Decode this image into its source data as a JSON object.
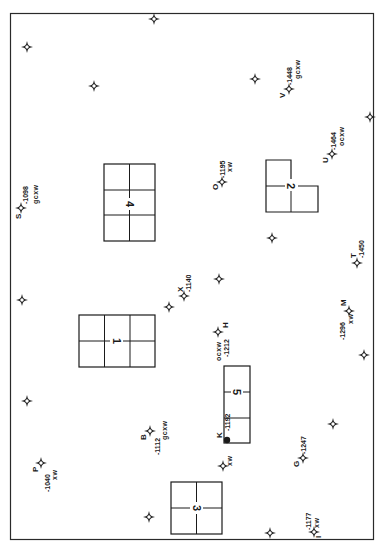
{
  "border_color": "#2a2a2a",
  "ink_color": "#1a1a1a",
  "units": [
    {
      "label": "1",
      "type": "grid-3x2"
    },
    {
      "label": "2",
      "type": "l-shape"
    },
    {
      "label": "3",
      "type": "grid-2x2"
    },
    {
      "label": "4",
      "type": "grid-3x2"
    },
    {
      "label": "5",
      "type": "strip-3"
    }
  ],
  "points": [
    {
      "id": "V",
      "letter": "V",
      "value": "-1448",
      "code": "gcxw",
      "symbol": "star"
    },
    {
      "id": "U",
      "letter": "U",
      "value": "-1464",
      "code": "ocxw",
      "symbol": "star"
    },
    {
      "id": "O",
      "letter": "O",
      "value": "-1195",
      "code": "xw",
      "symbol": "star"
    },
    {
      "id": "S",
      "letter": "S",
      "value": "-1098",
      "code": "gcxw",
      "symbol": "star"
    },
    {
      "id": "T",
      "letter": "T",
      "value": "-1450",
      "code": "",
      "symbol": "star"
    },
    {
      "id": "X",
      "letter": "X",
      "value": "-1140",
      "code": "",
      "symbol": "star"
    },
    {
      "id": "M",
      "letter": "M",
      "value": "-1296",
      "code": "xw",
      "symbol": "star"
    },
    {
      "id": "H",
      "letter": "H",
      "value": "-1212",
      "code": "ocxw",
      "symbol": "star"
    },
    {
      "id": "K",
      "letter": "K",
      "value": "-1192",
      "code": "",
      "symbol": "dot"
    },
    {
      "id": "B",
      "letter": "B",
      "value": "-1112",
      "code": "gcxw",
      "symbol": "star"
    },
    {
      "id": "P",
      "letter": "P",
      "value": "-1040",
      "code": "xw",
      "symbol": "star"
    },
    {
      "id": "G",
      "letter": "G",
      "value": "-1247",
      "code": "",
      "symbol": "star"
    },
    {
      "id": "I",
      "letter": "I",
      "value": "-1177",
      "code": "xw",
      "symbol": "star"
    },
    {
      "id": "xw-near-K",
      "letter": "",
      "value": "",
      "code": "xw",
      "symbol": "star"
    }
  ],
  "unlabeled_markers_count": 14
}
